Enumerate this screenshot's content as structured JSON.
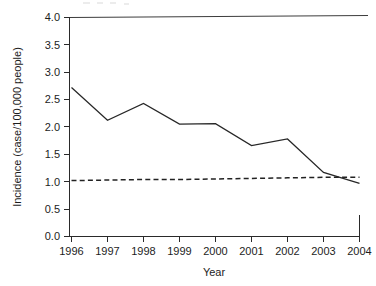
{
  "chart_data": {
    "type": "line",
    "title": "",
    "xlabel": "Year",
    "ylabel": "Incidence (case/100,000 people)",
    "x": [
      1996,
      1997,
      1998,
      1999,
      2000,
      2001,
      2002,
      2003,
      2004
    ],
    "xtick_labels": [
      "1996",
      "1997",
      "1998",
      "1999",
      "2000",
      "2001",
      "2002",
      "2003",
      "2004"
    ],
    "ytick_labels": [
      "0.0",
      "0.5",
      "1.0",
      "1.5",
      "2.0",
      "2.5",
      "3.0",
      "3.5",
      "4.0"
    ],
    "ytick_values": [
      0.0,
      0.5,
      1.0,
      1.5,
      2.0,
      2.5,
      3.0,
      3.5,
      4.0
    ],
    "ylim": [
      0.0,
      4.0
    ],
    "xlim": [
      1996,
      2004
    ],
    "grid": false,
    "legend": false,
    "series": [
      {
        "name": "Incidence",
        "style": "solid",
        "values": [
          2.72,
          2.12,
          2.43,
          2.05,
          2.06,
          1.66,
          1.78,
          1.17,
          0.97
        ]
      },
      {
        "name": "Reference level",
        "style": "dashed",
        "values": [
          1.02,
          1.03,
          1.04,
          1.04,
          1.05,
          1.06,
          1.07,
          1.08,
          1.08
        ]
      }
    ]
  },
  "axes": {
    "y_title": "Incidence (case/100,000 people)",
    "x_title": "Year"
  }
}
